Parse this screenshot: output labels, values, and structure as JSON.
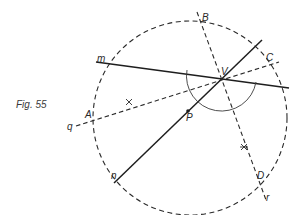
{
  "figure": {
    "caption": "Fig. 55",
    "colors": {
      "ink": "#2a2a2a",
      "background": "#ffffff"
    },
    "circle": {
      "cx": 190,
      "cy": 118,
      "r": 97,
      "style": "dashed"
    },
    "points": {
      "V": {
        "label": "V",
        "x": 220,
        "y": 78
      },
      "P": {
        "label": "P",
        "x": 188,
        "y": 111
      },
      "A": {
        "label": "A",
        "x": 96,
        "y": 121
      },
      "B": {
        "label": "B",
        "x": 201,
        "y": 22
      },
      "C": {
        "label": "C",
        "x": 267,
        "y": 66
      },
      "D": {
        "label": "D",
        "x": 253,
        "y": 175
      }
    },
    "lines": {
      "m": {
        "label": "m",
        "style": "solid"
      },
      "n": {
        "label": "n",
        "style": "solid"
      },
      "q": {
        "label": "q",
        "style": "dashed"
      },
      "r": {
        "label": "r",
        "style": "dashed"
      }
    },
    "labels": {
      "m": "m",
      "n": "n",
      "q": "q",
      "r": "r",
      "A": "A",
      "B": "B",
      "C": "C",
      "D": "D",
      "V": "V",
      "P": "P"
    }
  }
}
